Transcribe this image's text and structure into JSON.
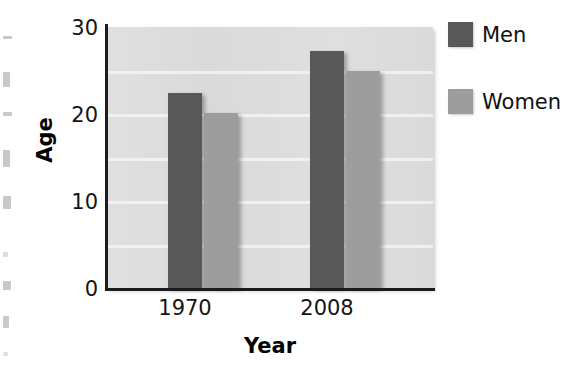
{
  "chart_data": {
    "type": "bar",
    "title": "",
    "xlabel": "Year",
    "ylabel": "Age",
    "categories": [
      "1970",
      "2008"
    ],
    "series": [
      {
        "name": "Men",
        "values": [
          22.4,
          27.2
        ],
        "color": "#585858"
      },
      {
        "name": "Women",
        "values": [
          20.1,
          25.0
        ],
        "color": "#9d9d9d"
      }
    ],
    "ylim": [
      0,
      30
    ],
    "yticks": [
      "0",
      "10",
      "20",
      "30"
    ],
    "ytick_values": [
      0,
      10,
      20,
      30
    ],
    "gridlines": true,
    "gridline_values": [
      5,
      10,
      15,
      20,
      25
    ],
    "legend_position": "right",
    "plot_background": "#d8d8d8",
    "gridline_color": "#f2f2f2",
    "axis_color": "#1c1c1c"
  },
  "axes": {
    "y_title": "Age",
    "x_title": "Year",
    "y_ticks": [
      {
        "label": "30",
        "value": 30
      },
      {
        "label": "20",
        "value": 20
      },
      {
        "label": "10",
        "value": 10
      },
      {
        "label": "0",
        "value": 0
      }
    ],
    "x_ticks": [
      {
        "label": "1970"
      },
      {
        "label": "2008"
      }
    ]
  },
  "legend": {
    "entries": [
      {
        "label": "Men",
        "color": "#585858"
      },
      {
        "label": "Women",
        "color": "#9d9d9d"
      }
    ]
  },
  "bars": [
    {
      "group": "1970",
      "series": "Men",
      "value": 22.4
    },
    {
      "group": "1970",
      "series": "Women",
      "value": 20.1
    },
    {
      "group": "2008",
      "series": "Men",
      "value": 27.2
    },
    {
      "group": "2008",
      "series": "Women",
      "value": 25.0
    }
  ]
}
